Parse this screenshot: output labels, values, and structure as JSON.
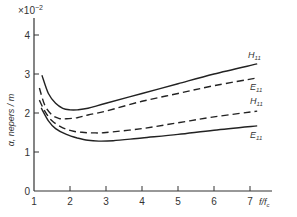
{
  "chart_data": {
    "type": "line",
    "title": "",
    "xlabel": "f/f_c",
    "ylabel": "α, nepers/m",
    "y_multiplier": "×10⁻²",
    "xlim": [
      1,
      7.6
    ],
    "ylim": [
      0,
      4.5
    ],
    "xticks": [
      "1",
      "2",
      "3",
      "4",
      "5",
      "6",
      "7"
    ],
    "yticks": [
      "0",
      "1",
      "2",
      "3",
      "4"
    ],
    "grid": false,
    "series": [
      {
        "name": "H11",
        "style": "solid",
        "label_pos": "upper",
        "x": [
          1.22,
          1.4,
          1.6,
          1.8,
          2.0,
          2.2,
          2.5,
          3,
          4,
          5,
          6,
          7.2
        ],
        "values": [
          2.97,
          2.5,
          2.25,
          2.12,
          2.08,
          2.08,
          2.12,
          2.25,
          2.5,
          2.75,
          3.0,
          3.26
        ]
      },
      {
        "name": "E11",
        "style": "dashed",
        "label_pos": "upper",
        "x": [
          1.15,
          1.3,
          1.5,
          1.7,
          1.9,
          2.2,
          2.5,
          3,
          4,
          5,
          6,
          7.2
        ],
        "values": [
          2.64,
          2.2,
          1.95,
          1.86,
          1.85,
          1.88,
          1.95,
          2.05,
          2.3,
          2.5,
          2.7,
          2.9
        ]
      },
      {
        "name": "H11",
        "style": "dashed",
        "label_pos": "lower",
        "x": [
          1.15,
          1.3,
          1.5,
          1.8,
          2.1,
          2.4,
          2.7,
          3,
          4,
          5,
          6,
          7.2
        ],
        "values": [
          2.33,
          2.05,
          1.8,
          1.62,
          1.53,
          1.5,
          1.49,
          1.5,
          1.6,
          1.75,
          1.9,
          2.05
        ]
      },
      {
        "name": "E11",
        "style": "solid",
        "label_pos": "lower",
        "x": [
          1.2,
          1.4,
          1.6,
          1.9,
          2.2,
          2.5,
          2.8,
          3.2,
          4,
          5,
          6,
          7.2
        ],
        "values": [
          2.13,
          1.8,
          1.6,
          1.45,
          1.36,
          1.3,
          1.28,
          1.29,
          1.36,
          1.45,
          1.56,
          1.67
        ]
      }
    ]
  },
  "labels": {
    "multiplier_prefix": "×10",
    "multiplier_exp": "−2",
    "ylabel": "α, nepers / m",
    "xlabel_f": "f",
    "xlabel_fc": "f",
    "xlabel_c": "c",
    "series_labels": [
      {
        "main": "H",
        "sub": "11"
      },
      {
        "main": "E",
        "sub": "11"
      },
      {
        "main": "H",
        "sub": "11"
      },
      {
        "main": "E",
        "sub": "11"
      }
    ]
  }
}
